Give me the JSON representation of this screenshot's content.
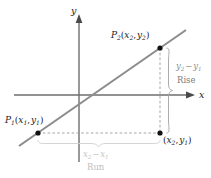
{
  "figure": {
    "type": "coordinate-geometry-diagram",
    "background_color": "#ffffff",
    "line_color": "#8c8c8c",
    "axis_color": "#6e6e6e",
    "dash_color": "#9a9a9a",
    "brace_color": "#9a9a9a",
    "run_brace_color": "#cfcfcf",
    "point_color": "#111111"
  },
  "axes": {
    "x_label": "x",
    "y_label": "y",
    "origin": {
      "x": 79,
      "y": 95
    }
  },
  "points": [
    {
      "id": "p1",
      "name": "P",
      "name_sub": "1",
      "coord_open": "(",
      "coord_x": "x",
      "coord_x_sub": "1",
      "coord_comma": ",",
      "coord_y": "y",
      "coord_y_sub": "1",
      "coord_close": ")",
      "px": 38,
      "py": 133
    },
    {
      "id": "p2",
      "name": "P",
      "name_sub": "2",
      "coord_open": "(",
      "coord_x": "x",
      "coord_x_sub": "2",
      "coord_comma": ",",
      "coord_y": "y",
      "coord_y_sub": "2",
      "coord_close": ")",
      "px": 160,
      "py": 48
    },
    {
      "id": "corner",
      "name": "",
      "name_sub": "",
      "coord_open": "(",
      "coord_x": "x",
      "coord_x_sub": "2",
      "coord_comma": ",",
      "coord_y": "y",
      "coord_y_sub": "1",
      "coord_close": ")",
      "px": 160,
      "py": 133
    }
  ],
  "measures": {
    "rise": {
      "expression_first": "y",
      "expression_first_sub": "2",
      "expression_minus": "−",
      "expression_second": "y",
      "expression_second_sub": "1",
      "word": "Rise"
    },
    "run": {
      "expression_first": "x",
      "expression_first_sub": "2",
      "expression_minus": "−",
      "expression_second": "x",
      "expression_second_sub": "1",
      "word": "Run"
    }
  }
}
